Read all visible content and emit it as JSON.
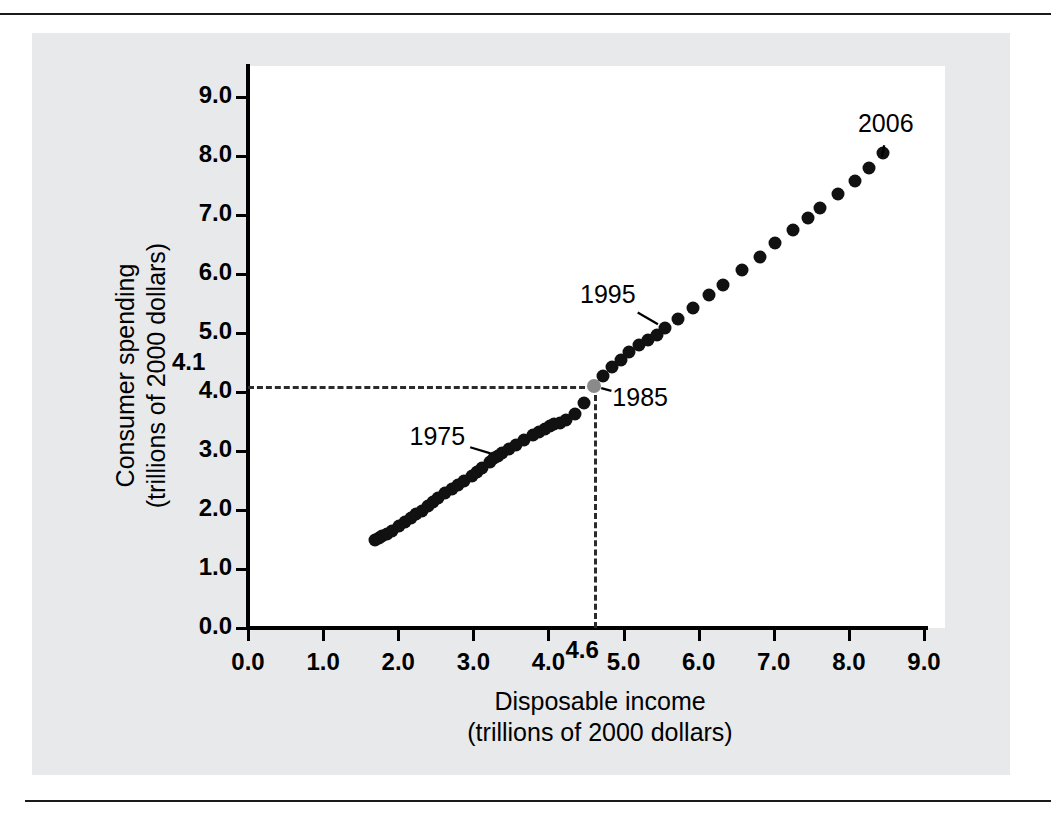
{
  "figure": {
    "background_color": "#e8e9ea",
    "plot_background_color": "#ffffff",
    "rule_color": "#1a1a1a"
  },
  "chart_data": {
    "type": "scatter",
    "title": "",
    "xlabel": "Disposable income\n(trillions of 2000 dollars)",
    "ylabel": "Consumer spending\n(trillions of 2000 dollars)",
    "xlim": [
      0.0,
      9.2
    ],
    "ylim": [
      0.0,
      9.4
    ],
    "grid": false,
    "legend": "none",
    "xtick_labels": [
      "0.0",
      "1.0",
      "2.0",
      "3.0",
      "4.0",
      "5.0",
      "6.0",
      "7.0",
      "8.0",
      "9.0"
    ],
    "xtick_values": [
      0.0,
      1.0,
      2.0,
      3.0,
      4.0,
      5.0,
      6.0,
      7.0,
      8.0,
      9.0
    ],
    "ytick_labels": [
      "0.0",
      "1.0",
      "2.0",
      "3.0",
      "4.0",
      "5.0",
      "6.0",
      "7.0",
      "8.0",
      "9.0"
    ],
    "ytick_values": [
      0.0,
      1.0,
      2.0,
      3.0,
      4.0,
      5.0,
      6.0,
      7.0,
      8.0,
      9.0
    ],
    "callouts": {
      "x_value_label": "4.6",
      "x_value": 4.6,
      "y_value_label": "4.1",
      "y_value": 4.1
    },
    "highlight_point": {
      "label": "1985",
      "x": 4.6,
      "y": 4.1,
      "color": "#8a8a8a"
    },
    "annotations": [
      {
        "label": "1975",
        "point_x": 3.33,
        "point_y": 2.92,
        "label_x": 2.55,
        "label_y": 3.22
      },
      {
        "label": "1985",
        "point_x": 4.6,
        "point_y": 4.1,
        "label_x": 5.25,
        "label_y": 3.88
      },
      {
        "label": "1995",
        "point_x": 5.55,
        "point_y": 5.08,
        "label_x": 4.82,
        "label_y": 5.62
      },
      {
        "label": "2006",
        "point_x": 8.45,
        "point_y": 8.05,
        "label_x": 8.52,
        "label_y": 8.52
      }
    ],
    "points": [
      {
        "x": 1.69,
        "y": 1.5
      },
      {
        "x": 1.74,
        "y": 1.53
      },
      {
        "x": 1.79,
        "y": 1.56
      },
      {
        "x": 1.85,
        "y": 1.6
      },
      {
        "x": 1.92,
        "y": 1.65
      },
      {
        "x": 2.01,
        "y": 1.73
      },
      {
        "x": 2.09,
        "y": 1.8
      },
      {
        "x": 2.17,
        "y": 1.87
      },
      {
        "x": 2.24,
        "y": 1.93
      },
      {
        "x": 2.31,
        "y": 1.99
      },
      {
        "x": 2.39,
        "y": 2.06
      },
      {
        "x": 2.46,
        "y": 2.13
      },
      {
        "x": 2.53,
        "y": 2.2
      },
      {
        "x": 2.62,
        "y": 2.28
      },
      {
        "x": 2.72,
        "y": 2.36
      },
      {
        "x": 2.79,
        "y": 2.42
      },
      {
        "x": 2.88,
        "y": 2.49
      },
      {
        "x": 2.98,
        "y": 2.58
      },
      {
        "x": 3.05,
        "y": 2.64
      },
      {
        "x": 3.12,
        "y": 2.72
      },
      {
        "x": 3.22,
        "y": 2.82
      },
      {
        "x": 3.28,
        "y": 2.88
      },
      {
        "x": 3.33,
        "y": 2.92
      },
      {
        "x": 3.38,
        "y": 2.96
      },
      {
        "x": 3.47,
        "y": 3.03
      },
      {
        "x": 3.57,
        "y": 3.1
      },
      {
        "x": 3.68,
        "y": 3.18
      },
      {
        "x": 3.8,
        "y": 3.27
      },
      {
        "x": 3.88,
        "y": 3.33
      },
      {
        "x": 3.95,
        "y": 3.38
      },
      {
        "x": 4.02,
        "y": 3.42
      },
      {
        "x": 4.08,
        "y": 3.45
      },
      {
        "x": 4.16,
        "y": 3.48
      },
      {
        "x": 4.23,
        "y": 3.52
      },
      {
        "x": 4.35,
        "y": 3.63
      },
      {
        "x": 4.47,
        "y": 3.81
      },
      {
        "x": 4.6,
        "y": 4.1
      },
      {
        "x": 4.72,
        "y": 4.27
      },
      {
        "x": 4.84,
        "y": 4.42
      },
      {
        "x": 4.96,
        "y": 4.55
      },
      {
        "x": 5.07,
        "y": 4.67
      },
      {
        "x": 5.2,
        "y": 4.79
      },
      {
        "x": 5.33,
        "y": 4.88
      },
      {
        "x": 5.44,
        "y": 4.97
      },
      {
        "x": 5.55,
        "y": 5.08
      },
      {
        "x": 5.72,
        "y": 5.24
      },
      {
        "x": 5.92,
        "y": 5.43
      },
      {
        "x": 6.14,
        "y": 5.65
      },
      {
        "x": 6.33,
        "y": 5.82
      },
      {
        "x": 6.58,
        "y": 6.06
      },
      {
        "x": 6.82,
        "y": 6.28
      },
      {
        "x": 7.02,
        "y": 6.52
      },
      {
        "x": 7.25,
        "y": 6.75
      },
      {
        "x": 7.45,
        "y": 6.95
      },
      {
        "x": 7.62,
        "y": 7.12
      },
      {
        "x": 7.85,
        "y": 7.36
      },
      {
        "x": 8.08,
        "y": 7.58
      },
      {
        "x": 8.27,
        "y": 7.8
      },
      {
        "x": 8.45,
        "y": 8.05
      }
    ]
  }
}
